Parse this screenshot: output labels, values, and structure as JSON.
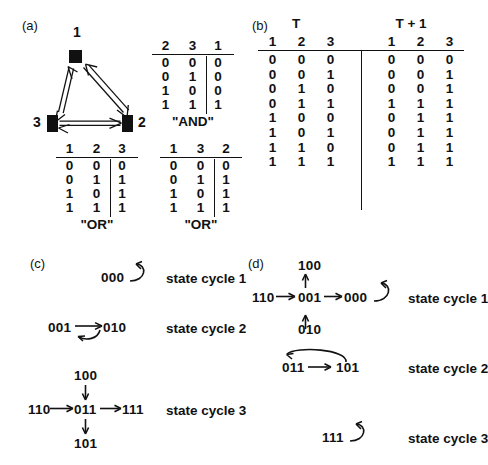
{
  "panels": {
    "a": {
      "label": "(a)",
      "network": {
        "nodes": [
          {
            "id": "1",
            "label": "1"
          },
          {
            "id": "2",
            "label": "2"
          },
          {
            "id": "3",
            "label": "3"
          }
        ],
        "edges": [
          {
            "from": "1",
            "to": "3"
          },
          {
            "from": "3",
            "to": "1"
          },
          {
            "from": "1",
            "to": "2"
          },
          {
            "from": "2",
            "to": "1"
          },
          {
            "from": "3",
            "to": "2"
          },
          {
            "from": "2",
            "to": "3"
          }
        ]
      },
      "tables": [
        {
          "name": "and-table",
          "inputs": [
            "2",
            "3"
          ],
          "output": "1",
          "caption": "\"AND\"",
          "rows": [
            {
              "inputs": [
                "0",
                "0"
              ],
              "output": "0"
            },
            {
              "inputs": [
                "0",
                "1"
              ],
              "output": "0"
            },
            {
              "inputs": [
                "1",
                "0"
              ],
              "output": "0"
            },
            {
              "inputs": [
                "1",
                "1"
              ],
              "output": "1"
            }
          ]
        },
        {
          "name": "or-table-3",
          "inputs": [
            "1",
            "2"
          ],
          "output": "3",
          "caption": "\"OR\"",
          "rows": [
            {
              "inputs": [
                "0",
                "0"
              ],
              "output": "0"
            },
            {
              "inputs": [
                "0",
                "1"
              ],
              "output": "1"
            },
            {
              "inputs": [
                "1",
                "0"
              ],
              "output": "1"
            },
            {
              "inputs": [
                "1",
                "1"
              ],
              "output": "1"
            }
          ]
        },
        {
          "name": "or-table-2",
          "inputs": [
            "1",
            "3"
          ],
          "output": "2",
          "caption": "\"OR\"",
          "rows": [
            {
              "inputs": [
                "0",
                "0"
              ],
              "output": "0"
            },
            {
              "inputs": [
                "0",
                "1"
              ],
              "output": "1"
            },
            {
              "inputs": [
                "1",
                "0"
              ],
              "output": "1"
            },
            {
              "inputs": [
                "1",
                "1"
              ],
              "output": "1"
            }
          ]
        }
      ]
    },
    "b": {
      "label": "(b)",
      "time_t": "T",
      "time_t1": "T + 1",
      "headers_t": [
        "1",
        "2",
        "3"
      ],
      "headers_t1": [
        "1",
        "2",
        "3"
      ],
      "rows": [
        {
          "t": [
            "0",
            "0",
            "0"
          ],
          "t1": [
            "0",
            "0",
            "0"
          ]
        },
        {
          "t": [
            "0",
            "0",
            "1"
          ],
          "t1": [
            "0",
            "0",
            "1"
          ]
        },
        {
          "t": [
            "0",
            "1",
            "0"
          ],
          "t1": [
            "0",
            "0",
            "1"
          ]
        },
        {
          "t": [
            "0",
            "1",
            "1"
          ],
          "t1": [
            "1",
            "1",
            "1"
          ]
        },
        {
          "t": [
            "1",
            "0",
            "0"
          ],
          "t1": [
            "0",
            "1",
            "1"
          ]
        },
        {
          "t": [
            "1",
            "0",
            "1"
          ],
          "t1": [
            "0",
            "1",
            "1"
          ]
        },
        {
          "t": [
            "1",
            "1",
            "0"
          ],
          "t1": [
            "0",
            "1",
            "1"
          ]
        },
        {
          "t": [
            "1",
            "1",
            "1"
          ],
          "t1": [
            "1",
            "1",
            "1"
          ]
        }
      ]
    },
    "c": {
      "label": "(c)",
      "cycles": [
        {
          "name": "state-cycle-1",
          "label": "state cycle 1",
          "states": [
            "000"
          ],
          "transitions": [
            {
              "from": "000",
              "to": "000",
              "kind": "self-loop"
            }
          ]
        },
        {
          "name": "state-cycle-2",
          "label": "state cycle 2",
          "states": [
            "001",
            "010"
          ],
          "transitions": [
            {
              "from": "001",
              "to": "010",
              "kind": "straight"
            },
            {
              "from": "010",
              "to": "001",
              "kind": "return-curve-below"
            }
          ]
        },
        {
          "name": "state-cycle-3",
          "label": "state cycle 3",
          "states": [
            "100",
            "110",
            "011",
            "111",
            "101"
          ],
          "transitions": [
            {
              "from": "100",
              "to": "011",
              "kind": "down"
            },
            {
              "from": "110",
              "to": "011",
              "kind": "right"
            },
            {
              "from": "011",
              "to": "111",
              "kind": "right"
            },
            {
              "from": "011",
              "to": "101",
              "kind": "down"
            }
          ]
        }
      ]
    },
    "d": {
      "label": "(d)",
      "cycles": [
        {
          "name": "state-cycle-1",
          "label": "state cycle 1",
          "states": [
            "100",
            "110",
            "001",
            "000",
            "010"
          ],
          "transitions": [
            {
              "from": "100",
              "to": "001",
              "kind": "up"
            },
            {
              "from": "010",
              "to": "001",
              "kind": "up"
            },
            {
              "from": "110",
              "to": "001",
              "kind": "right"
            },
            {
              "from": "001",
              "to": "000",
              "kind": "right"
            },
            {
              "from": "000",
              "to": "000",
              "kind": "self-loop"
            }
          ]
        },
        {
          "name": "state-cycle-2",
          "label": "state cycle 2",
          "states": [
            "011",
            "101"
          ],
          "transitions": [
            {
              "from": "011",
              "to": "101",
              "kind": "straight"
            },
            {
              "from": "101",
              "to": "011",
              "kind": "return-curve-above"
            }
          ]
        },
        {
          "name": "state-cycle-3",
          "label": "state cycle 3",
          "states": [
            "111"
          ],
          "transitions": [
            {
              "from": "111",
              "to": "111",
              "kind": "self-loop"
            }
          ]
        }
      ]
    }
  },
  "colors": {
    "ink": "#111111",
    "background": "#ffffff"
  }
}
